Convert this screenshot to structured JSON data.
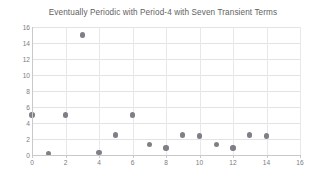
{
  "chart_data": {
    "type": "scatter",
    "title": "Eventually Periodic with Period-4 with Seven Transient Terms",
    "xlabel": "",
    "ylabel": "",
    "xlim": [
      0,
      16
    ],
    "ylim": [
      0,
      16
    ],
    "x_ticks": [
      "0",
      "2",
      "4",
      "6",
      "8",
      "10",
      "12",
      "14",
      "16"
    ],
    "y_ticks": [
      "0",
      "2",
      "4",
      "6",
      "8",
      "10",
      "12",
      "14",
      "16"
    ],
    "x_tick_values": [
      0,
      2,
      4,
      6,
      8,
      10,
      12,
      14,
      16
    ],
    "y_tick_values": [
      0,
      2,
      4,
      6,
      8,
      10,
      12,
      14,
      16
    ],
    "grid": true,
    "legend": false,
    "marker_color": "#7f7f86",
    "gridline_color": "#e3e3e6",
    "axis_color": "#c9c9cc",
    "background_color": "#ffffff",
    "x": [
      0,
      1,
      2,
      3,
      4,
      5,
      6,
      7,
      8,
      9,
      10,
      11,
      12,
      13,
      14
    ],
    "values": [
      5,
      0.2,
      5,
      15,
      0.3,
      2.5,
      5,
      1.3,
      0.9,
      2.5,
      2.4,
      1.3,
      0.9,
      2.5,
      2.4
    ],
    "points": [
      {
        "x": 0,
        "y": 5
      },
      {
        "x": 1,
        "y": 0.2
      },
      {
        "x": 2,
        "y": 5
      },
      {
        "x": 3,
        "y": 15
      },
      {
        "x": 4,
        "y": 0.3
      },
      {
        "x": 5,
        "y": 2.5
      },
      {
        "x": 6,
        "y": 5
      },
      {
        "x": 7,
        "y": 1.3
      },
      {
        "x": 8,
        "y": 0.9
      },
      {
        "x": 9,
        "y": 2.5
      },
      {
        "x": 10,
        "y": 2.4
      },
      {
        "x": 11,
        "y": 1.3
      },
      {
        "x": 12,
        "y": 0.9
      },
      {
        "x": 13,
        "y": 2.5
      },
      {
        "x": 14,
        "y": 2.4
      }
    ]
  }
}
